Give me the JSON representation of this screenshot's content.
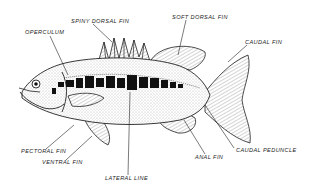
{
  "diagram": {
    "labels": [
      {
        "id": "operculum",
        "text": "OPERCULUM",
        "x": 25,
        "y": 30
      },
      {
        "id": "spiny-dorsal-fin",
        "text": "SPINY DORSAL FIN",
        "x": 71,
        "y": 19
      },
      {
        "id": "soft-dorsal-fin",
        "text": "SOFT DORSAL FIN",
        "x": 172,
        "y": 15
      },
      {
        "id": "caudal-fin",
        "text": "CAUDAL FIN",
        "x": 245,
        "y": 40
      },
      {
        "id": "pectoral-fin",
        "text": "PECTORAL FIN",
        "x": 21,
        "y": 149
      },
      {
        "id": "ventral-fin",
        "text": "VENTRAL FIN",
        "x": 42,
        "y": 160
      },
      {
        "id": "lateral-line",
        "text": "LATERAL LINE",
        "x": 105,
        "y": 176
      },
      {
        "id": "anal-fin",
        "text": "ANAL FIN",
        "x": 195,
        "y": 155
      },
      {
        "id": "caudal-peduncle",
        "text": "CAUDAL PEDUNCLE",
        "x": 236,
        "y": 148
      }
    ],
    "colors": {
      "ink": "#1a1a1a",
      "background": "#ffffff",
      "shade": "#bdbdbd"
    }
  }
}
